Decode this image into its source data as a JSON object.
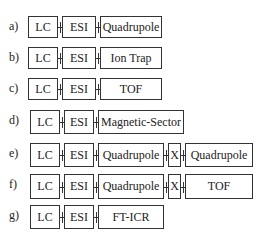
{
  "rows": [
    {
      "label": "a)",
      "top": 16,
      "h": 22,
      "stages": [
        {
          "text": "LC",
          "x": 28,
          "w": 30
        },
        {
          "text": "ESI",
          "x": 62,
          "w": 34
        },
        {
          "text": "Quadrupole",
          "x": 100,
          "w": 62
        }
      ]
    },
    {
      "label": "b)",
      "top": 47,
      "h": 22,
      "stages": [
        {
          "text": "LC",
          "x": 28,
          "w": 30
        },
        {
          "text": "ESI",
          "x": 62,
          "w": 34
        },
        {
          "text": "Ion Trap",
          "x": 100,
          "w": 62
        }
      ]
    },
    {
      "label": "c)",
      "top": 78,
      "h": 22,
      "stages": [
        {
          "text": "LC",
          "x": 28,
          "w": 30
        },
        {
          "text": "ESI",
          "x": 62,
          "w": 34
        },
        {
          "text": "TOF",
          "x": 100,
          "w": 62
        }
      ]
    },
    {
      "label": "d)",
      "top": 110,
      "h": 24,
      "stages": [
        {
          "text": "LC",
          "x": 30,
          "w": 30
        },
        {
          "text": "ESI",
          "x": 64,
          "w": 30
        },
        {
          "text": "Magnetic-Sector",
          "x": 98,
          "w": 86
        }
      ]
    },
    {
      "label": "e)",
      "top": 143,
      "h": 24,
      "stages": [
        {
          "text": "LC",
          "x": 30,
          "w": 30
        },
        {
          "text": "ESI",
          "x": 64,
          "w": 30
        },
        {
          "text": "Quadrupole",
          "x": 98,
          "w": 66
        },
        {
          "text": "X",
          "x": 168,
          "w": 13
        },
        {
          "text": "Quadrupole",
          "x": 185,
          "w": 68
        }
      ]
    },
    {
      "label": "f)",
      "top": 174,
      "h": 25,
      "stages": [
        {
          "text": "LC",
          "x": 30,
          "w": 30
        },
        {
          "text": "ESI",
          "x": 64,
          "w": 30
        },
        {
          "text": "Quadrupole",
          "x": 98,
          "w": 66
        },
        {
          "text": "X",
          "x": 168,
          "w": 13
        },
        {
          "text": "TOF",
          "x": 185,
          "w": 68
        }
      ]
    },
    {
      "label": "g)",
      "top": 205,
      "h": 24,
      "stages": [
        {
          "text": "LC",
          "x": 30,
          "w": 30
        },
        {
          "text": "ESI",
          "x": 64,
          "w": 30
        },
        {
          "text": "FT-ICR",
          "x": 98,
          "w": 66
        }
      ]
    }
  ]
}
